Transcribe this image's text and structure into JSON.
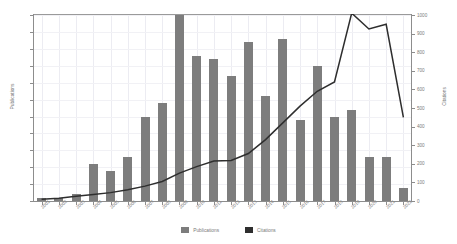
{
  "chart_data": {
    "type": "bar",
    "title": "",
    "subtitle": "",
    "xlabel": "",
    "ylabel": "Publications",
    "y2label": "Citations",
    "grid": true,
    "legend_position": "bottom",
    "categories": [
      "2001",
      "2002",
      "2003",
      "2004",
      "2005",
      "2006",
      "2007",
      "2008",
      "2009",
      "2010",
      "2011",
      "2012",
      "2013",
      "2014",
      "2015",
      "2016",
      "2017",
      "2018",
      "2019",
      "2020",
      "2021",
      "2022"
    ],
    "ylim": [
      0,
      55
    ],
    "y2lim": [
      0,
      1000
    ],
    "yticks": [
      0,
      5,
      10,
      15,
      20,
      25,
      30,
      35,
      40,
      45,
      50,
      55
    ],
    "y2ticks": [
      0,
      100,
      200,
      300,
      400,
      500,
      600,
      700,
      800,
      900,
      1000
    ],
    "series": [
      {
        "name": "Publications",
        "chart_type": "bar",
        "axis": "left",
        "color": "#7d7d7d",
        "values": [
          1,
          1,
          2,
          11,
          9,
          13,
          25,
          29,
          55,
          43,
          42,
          37,
          47,
          31,
          48,
          24,
          40,
          25,
          27,
          13,
          13,
          4
        ]
      },
      {
        "name": "Citations",
        "chart_type": "line",
        "axis": "right",
        "color": "#2e2e2e",
        "values": [
          10,
          15,
          25,
          35,
          45,
          60,
          80,
          105,
          150,
          185,
          215,
          218,
          255,
          330,
          420,
          510,
          590,
          640,
          1010,
          925,
          950,
          450
        ]
      }
    ]
  },
  "legend": {
    "publications_label": "Publications",
    "citations_label": "Citations"
  },
  "axes": {
    "left_title": "Publications",
    "right_title": "Citations"
  }
}
